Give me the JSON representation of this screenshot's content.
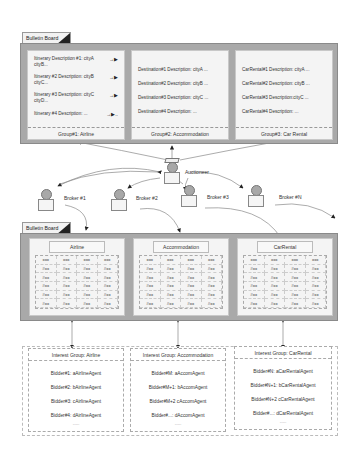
{
  "top_board": {
    "tab_label": "Bulletin Board",
    "groups": [
      {
        "footer": "Group#1: Airline",
        "lines": [
          "Itinerary Description #1: cityA",
          "cityB...",
          "Itinerary #2 Description: cityB",
          "cityC...",
          "Itinerary #3 Description: cityC",
          "cityD...",
          "Itinerary #4 Description:   ...",
          "→▶ ..."
        ]
      },
      {
        "footer": "Group#2: Accommodation",
        "lines": [
          "Destination#1 Description: cityA   ...",
          "Destination#2 Description: cityB   ...",
          "Destination#3 Description: cityC   ...",
          "Destination#4 Description:   ..."
        ]
      },
      {
        "footer": "Group#3: Car Rental",
        "lines": [
          "CarRental#1 Description: cityA   ...",
          "CarRental#2 Description: cityB   ...",
          "CarRental#3 Description:cityC   ...",
          "CarRental#4 Description:   ..."
        ]
      }
    ]
  },
  "actors": {
    "auctioneer": "Auctioneer",
    "brokers": [
      "Broker #1",
      "Broker #2",
      "Broker #3",
      "Broker #N"
    ]
  },
  "bottom_board": {
    "tab_label": "Bulletin Board",
    "tables": [
      {
        "title": "Airline",
        "rows": [
          [
            "xxx",
            "xxx",
            "xxx",
            "xxx"
          ],
          [
            "#xx",
            "#xx",
            "#xx",
            "#xx"
          ],
          [
            "#xx",
            "#xx",
            "#xx",
            "#xx"
          ],
          [
            "#xx",
            "#xx",
            "#xx",
            "#xx"
          ],
          [
            "#xx",
            "#xx",
            "#xx",
            "#xx"
          ],
          [
            "#xx",
            "#xx",
            "#xx",
            "#xx"
          ]
        ]
      },
      {
        "title": "Accommodation",
        "rows": [
          [
            "xxx",
            "xxx",
            "xxx",
            "xxx"
          ],
          [
            "#xx",
            "#xx",
            "#xx",
            "#xx"
          ],
          [
            "#xx",
            "#xx",
            "#xx",
            "#xx"
          ],
          [
            "#xx",
            "#xx",
            "#xx",
            "#xx"
          ],
          [
            "#xx",
            "#xx",
            "#xx",
            "#xx"
          ],
          [
            "#xx",
            "#xx",
            "#xx",
            "#xx"
          ]
        ]
      },
      {
        "title": "CarRental",
        "rows": [
          [
            "xxx",
            "xxx",
            "xxx",
            "xxx"
          ],
          [
            "#xx",
            "#xx",
            "#xx",
            "#xx"
          ],
          [
            "#xx",
            "#xx",
            "#xx",
            "#xx"
          ],
          [
            "#xx",
            "#xx",
            "#xx",
            "#xx"
          ],
          [
            "#xx",
            "#xx",
            "#xx",
            "#xx"
          ],
          [
            "#xx",
            "#xx",
            "#xx",
            "#xx"
          ]
        ]
      }
    ]
  },
  "interest_groups": [
    {
      "title": "Interest Group: Airline",
      "bidders": [
        "Bidder#1: aAirlineAgent",
        "Bidder#2: bAirlineAgent",
        "Bidder#3: cAirlineAgent",
        "Bidder#4: dAirlineAgent"
      ],
      "more": "......"
    },
    {
      "title": "Interest Group: Accommodation",
      "bidders": [
        "Bidder#M: aAccomAgent",
        "Bidder#M+1: bAccomAgent",
        "Bidder#M+2 cAccomAgent",
        "Bidder#...: dAccomAgent"
      ],
      "more": "......"
    },
    {
      "title": "Interest Group: CarRental",
      "bidders": [
        "Bidder#N: aCarRentalAgent",
        "Bidder#N+1: bCarRentalAgent",
        "Bidder#N+2 cCarRentalAgent",
        "Bidder#...: dCarRentalAgent"
      ],
      "more": "......"
    }
  ]
}
